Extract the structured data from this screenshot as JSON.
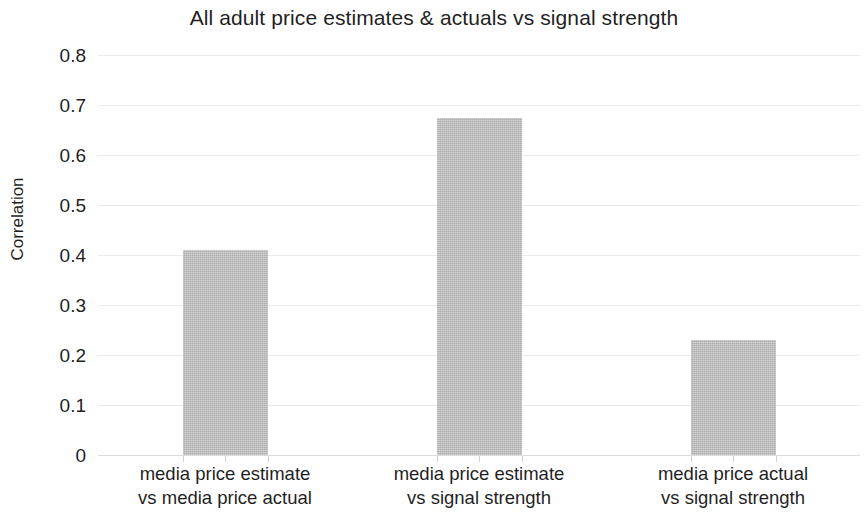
{
  "chart_data": {
    "type": "bar",
    "title": "All adult price estimates & actuals vs signal strength",
    "xlabel": "",
    "ylabel": "Correlation",
    "ylim": [
      0,
      0.8
    ],
    "grid": true,
    "legend": "none",
    "categories": [
      "media price estimate vs media price actual",
      "media price estimate vs signal strength",
      "media price actual vs signal strength"
    ],
    "category_lines": [
      [
        "media price estimate",
        "vs media price actual"
      ],
      [
        "media price estimate",
        "vs signal strength"
      ],
      [
        "media price actual",
        "vs signal strength"
      ]
    ],
    "values": [
      0.41,
      0.675,
      0.23
    ],
    "y_ticks": [
      "0",
      "0.1",
      "0.2",
      "0.3",
      "0.4",
      "0.5",
      "0.6",
      "0.7",
      "0.8"
    ],
    "y_tick_values": [
      0,
      0.1,
      0.2,
      0.3,
      0.4,
      0.5,
      0.6,
      0.7,
      0.8
    ],
    "bar_color": "#bfbfbf",
    "grid_color": "#ebebeb",
    "text_color": "#1f1f1f"
  }
}
